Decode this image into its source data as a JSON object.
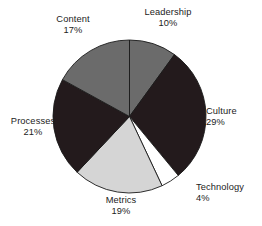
{
  "chart_data": {
    "type": "pie",
    "title": "",
    "subtitle": "",
    "xlabel": "",
    "ylabel": "",
    "legend_position": "none",
    "grid": false,
    "labels_outside": true,
    "start_angle_deg": 0,
    "direction": "clockwise",
    "categories": [
      "Leadership",
      "Culture",
      "Technology",
      "Metrics",
      "Processes",
      "Content"
    ],
    "values": [
      10,
      29,
      4,
      19,
      21,
      17
    ],
    "value_suffix": "%",
    "slices": [
      {
        "label": "Leadership",
        "value": 10,
        "value_text": "10%",
        "color": "#6b6b6b"
      },
      {
        "label": "Culture",
        "value": 29,
        "value_text": "29%",
        "color": "#231a1c"
      },
      {
        "label": "Technology",
        "value": 4,
        "value_text": "4%",
        "color": "#ffffff"
      },
      {
        "label": "Metrics",
        "value": 19,
        "value_text": "19%",
        "color": "#d5d5d5"
      },
      {
        "label": "Processes",
        "value": 21,
        "value_text": "21%",
        "color": "#231a1c"
      },
      {
        "label": "Content",
        "value": 17,
        "value_text": "17%",
        "color": "#6b6b6b"
      }
    ],
    "outline_color": "#1a1a1a",
    "background_color": "#ffffff"
  },
  "labels": {
    "leadership": {
      "name": "Leadership",
      "value": "10%"
    },
    "culture": {
      "name": "Culture",
      "value": "29%"
    },
    "technology": {
      "name": "Technology",
      "value": "4%"
    },
    "metrics": {
      "name": "Metrics",
      "value": "19%"
    },
    "processes": {
      "name": "Processes",
      "value": "21%"
    },
    "content": {
      "name": "Content",
      "value": "17%"
    }
  }
}
